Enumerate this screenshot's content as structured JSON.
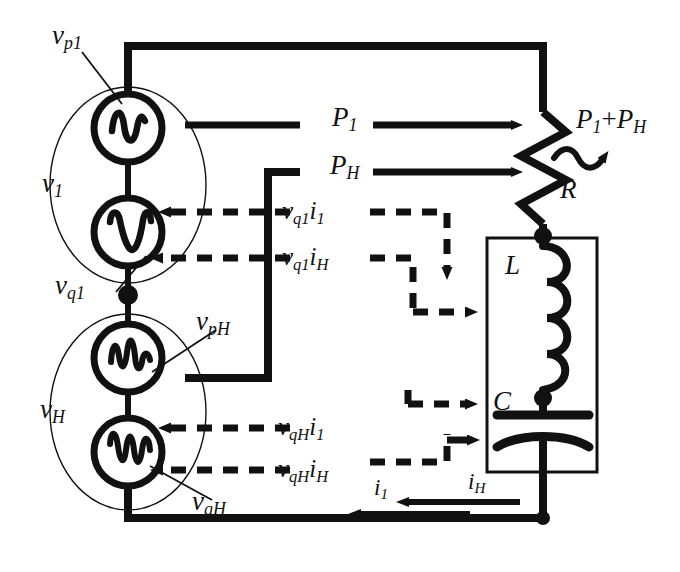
{
  "figure": {
    "kind": "circuit-diagram",
    "background_color": "#ffffff",
    "line_color": "#111111"
  },
  "sources": {
    "group_fundamental": {
      "group_label": "v",
      "group_sub": "1",
      "members": [
        {
          "label": "v",
          "sub": "p1",
          "waveform": "sine-wave-icon"
        },
        {
          "label": "v",
          "sub": "q1",
          "waveform": "quadrature-wave-icon"
        }
      ]
    },
    "group_harmonic": {
      "group_label": "v",
      "group_sub": "H",
      "members": [
        {
          "label": "v",
          "sub": "pH",
          "waveform": "harmonic-wave-icon"
        },
        {
          "label": "v",
          "sub": "qH",
          "waveform": "harmonic-wave-icon"
        }
      ]
    }
  },
  "load": {
    "resistor": {
      "label": "R",
      "symbol": "zigzag-resistor-icon"
    },
    "inductor": {
      "label": "L",
      "symbol": "coil-inductor-icon"
    },
    "capacitor": {
      "label": "C",
      "symbol": "curved-capacitor-icon"
    }
  },
  "power_flows": [
    {
      "name": "p1",
      "label": "P",
      "sub": "1",
      "style": "solid",
      "direction": "right"
    },
    {
      "name": "pH",
      "label": "P",
      "sub": "H",
      "style": "solid",
      "direction": "right"
    }
  ],
  "dissipation": {
    "label_a": "P",
    "sub_a": "1",
    "plus": "+",
    "label_b": "P",
    "sub_b": "H",
    "style": "wavy-arrow"
  },
  "cross_terms": [
    {
      "v": "v",
      "v_sub": "q1",
      "i": "i",
      "i_sub": "1",
      "style": "dashed"
    },
    {
      "v": "v",
      "v_sub": "q1",
      "i": "i",
      "i_sub": "H",
      "style": "dashed"
    },
    {
      "v": "v",
      "v_sub": "qH",
      "i": "i",
      "i_sub": "1",
      "style": "dashed"
    },
    {
      "v": "v",
      "v_sub": "qH",
      "i": "i",
      "i_sub": "H",
      "style": "dashed"
    }
  ],
  "currents": [
    {
      "label": "i",
      "sub": "1",
      "direction": "left"
    },
    {
      "label": "i",
      "sub": "H",
      "direction": "left"
    }
  ]
}
